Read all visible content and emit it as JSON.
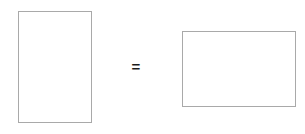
{
  "figure": {
    "background_color": "#ffffff",
    "width": 305,
    "height": 134,
    "stroke_color": "#a9a9a9",
    "fill_color": "#ffffff",
    "symbol_color": "#1b1b1b",
    "shapes": [
      {
        "name": "left-rectangle",
        "orientation": "portrait",
        "label": "",
        "x": 18,
        "y": 11,
        "width": 74,
        "height": 112
      },
      {
        "name": "right-rectangle",
        "orientation": "landscape",
        "label": "",
        "x": 182,
        "y": 31,
        "width": 114,
        "height": 76
      }
    ],
    "relation": {
      "name": "equals",
      "symbol": "=",
      "x": 129,
      "y": 56
    }
  }
}
